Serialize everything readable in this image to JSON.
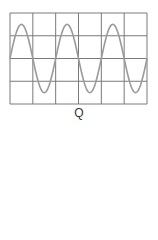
{
  "figure": {
    "label": "Q",
    "grid": {
      "columns": 6,
      "rows": 4,
      "left": 10,
      "top": 13,
      "right": 147,
      "bottom": 104,
      "line_color": "#7a7a7a"
    },
    "waveform": {
      "type": "sine",
      "cycles": 3,
      "amplitude_divisions": 1.5,
      "color": "#9a9a9a",
      "start_phase": "rising-from-center"
    }
  }
}
